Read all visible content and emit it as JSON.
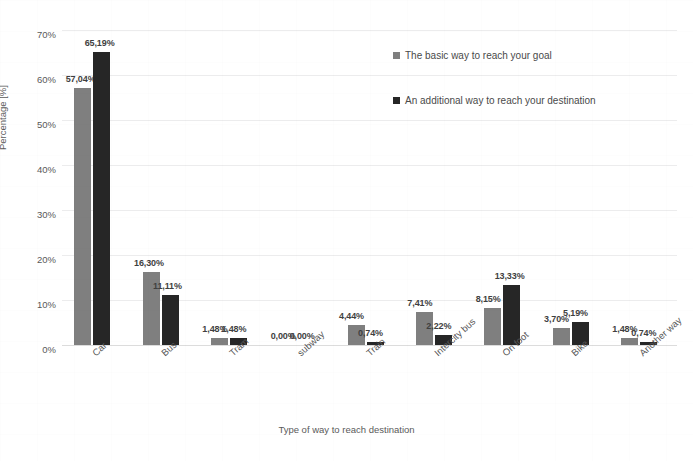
{
  "chart_data": {
    "type": "bar",
    "title": "",
    "xlabel": "Type of way to reach destination",
    "ylabel": "Percentage [%]",
    "ylim": [
      0,
      70
    ],
    "ytick_labels": [
      "0%",
      "10%",
      "20%",
      "30%",
      "40%",
      "50%",
      "60%",
      "70%"
    ],
    "ytick_values": [
      0,
      10,
      20,
      30,
      40,
      50,
      60,
      70
    ],
    "grid": true,
    "legend_position": "upper-right-inside",
    "decimal_separator": ",",
    "categories": [
      "Car",
      "Bus",
      "Tram",
      "subway",
      "Train",
      "Intercity bus",
      "On foot",
      "Bike",
      "Another way"
    ],
    "series": [
      {
        "name": "The basic way to reach your goal",
        "color": "#7f7f7f",
        "values": [
          57.04,
          16.3,
          1.48,
          0.0,
          4.44,
          7.41,
          8.15,
          3.7,
          1.48
        ],
        "labels": [
          "57,04%",
          "16,30%",
          "1,48%",
          "0,00%",
          "4,44%",
          "7,41%",
          "8,15%",
          "3,70%",
          "1,48%"
        ]
      },
      {
        "name": "An additional way to reach your destination",
        "color": "#262626",
        "values": [
          65.19,
          11.11,
          1.48,
          0.0,
          0.74,
          2.22,
          13.33,
          5.19,
          0.74
        ],
        "labels": [
          "65,19%",
          "11,11%",
          "1,48%",
          "0,00%",
          "0,74%",
          "2,22%",
          "13,33%",
          "5,19%",
          "0,74%"
        ]
      }
    ]
  }
}
